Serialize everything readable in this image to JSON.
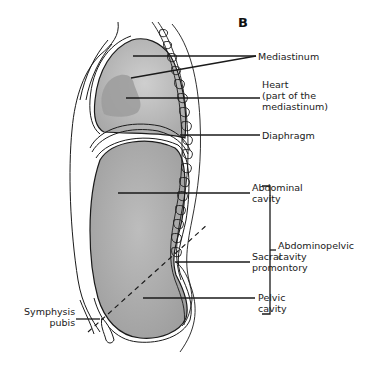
{
  "figure": {
    "panel_letter": "B",
    "labels": {
      "mediastinum": "Mediastinum",
      "heart_line1": "Heart",
      "heart_line2": "(part of the",
      "heart_line3": "mediastinum)",
      "diaphragm": "Diaphragm",
      "abdominal_line1": "Abdominal",
      "abdominal_line2": "cavity",
      "sacral_line1": "Sacral",
      "sacral_line2": "promontory",
      "pelvic_line1": "Pelvic",
      "pelvic_line2": "cavity",
      "symphysis_line1": "Symphysis",
      "symphysis_line2": "pubis",
      "abdominopelvic_line1": "Abdominopelvic",
      "abdominopelvic_line2": "cavity"
    },
    "colors": {
      "cavity_fill": "#a9a9a9",
      "cavity_light": "#c8c8c8",
      "heart_fill": "#9c9c9c",
      "outline": "#1a1a1a",
      "background": "#ffffff"
    }
  }
}
